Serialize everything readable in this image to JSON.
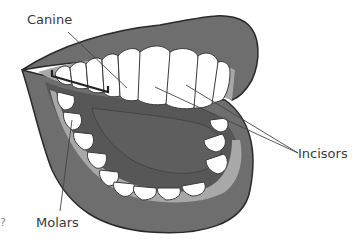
{
  "diagram": {
    "title": "",
    "labels": {
      "canine": "Canine",
      "incisors": "Incisors",
      "molars": "Molars"
    },
    "edge_fragment": "?",
    "colors": {
      "lip": "#6e6e6e",
      "lip_outline": "#2a2a2a",
      "gum": "#a8a8a8",
      "mouth_interior": "#575757",
      "tongue": "#5e5e5e",
      "tooth": "#ffffff",
      "tooth_outline": "#3a3a3a",
      "pointer_line": "#444444",
      "bracket": "#222222",
      "text": "#3a3a3a"
    }
  }
}
